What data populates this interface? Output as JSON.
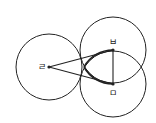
{
  "diagram": {
    "type": "geometry",
    "stroke_color": "#222222",
    "background": "#ffffff",
    "circles": [
      {
        "id": "left",
        "cx": 49,
        "cy": 67,
        "r": 33
      },
      {
        "id": "top",
        "cx": 113,
        "cy": 50,
        "r": 33
      },
      {
        "id": "bottom",
        "cx": 113,
        "cy": 84,
        "r": 33
      }
    ],
    "points": [
      {
        "id": "p-left",
        "label": "ㄹ",
        "x": 49,
        "y": 67,
        "label_x": 38,
        "label_y": 70
      },
      {
        "id": "p-top",
        "label": "ㅂ",
        "x": 113,
        "y": 50,
        "label_x": 109,
        "label_y": 45
      },
      {
        "id": "p-bottom",
        "label": "ㅁ",
        "x": 113,
        "y": 84,
        "label_x": 109,
        "label_y": 96
      }
    ],
    "segments": [
      {
        "from": "p-left",
        "to": "p-top"
      },
      {
        "from": "p-left",
        "to": "p-bottom"
      },
      {
        "from": "p-top",
        "to": "p-bottom"
      }
    ]
  }
}
